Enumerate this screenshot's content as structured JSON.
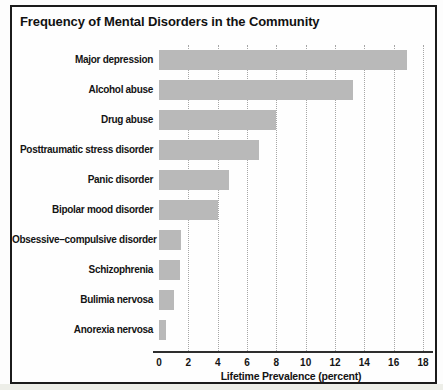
{
  "chart_data": {
    "type": "bar",
    "orientation": "horizontal",
    "title": "Frequency of Mental Disorders in the Community",
    "xlabel": "Lifetime Prevalence (percent)",
    "categories": [
      "Major depression",
      "Alcohol abuse",
      "Drug abuse",
      "Posttraumatic stress disorder",
      "Panic disorder",
      "Bipolar mood disorder",
      "Obsessive–compulsive disorder",
      "Schizophrenia",
      "Bulimia nervosa",
      "Anorexia nervosa"
    ],
    "values": [
      16.9,
      13.2,
      8.0,
      6.8,
      4.8,
      4.0,
      1.5,
      1.4,
      1.0,
      0.5
    ],
    "xlim": [
      0,
      18
    ],
    "xticks": [
      0,
      2,
      4,
      6,
      8,
      10,
      12,
      14,
      16,
      18
    ],
    "grid": "dotted-vertical",
    "legend": "none",
    "bar_color": "#b9b9b9",
    "axis_color": "#2e2e2e",
    "gridline_color": "#a6a6a6"
  }
}
